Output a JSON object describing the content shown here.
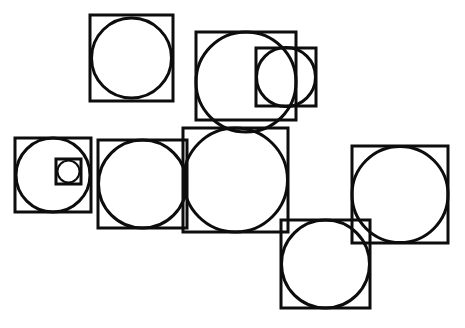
{
  "figure": {
    "canvas": {
      "width": 465,
      "height": 328,
      "background": "#ffffff"
    },
    "stroke_color": "#0d0d0d",
    "fill_color": "none",
    "groups": [
      {
        "id": "group-1-top-left",
        "label": "top-left square with inscribed circle",
        "square": {
          "x": 90,
          "y": 15,
          "w": 83,
          "h": 86,
          "stroke_width": 3
        },
        "circle": {
          "cx": 131.5,
          "cy": 58,
          "r": 40,
          "stroke_width": 3
        }
      },
      {
        "id": "group-2-top-middle",
        "label": "top-middle large square with inscribed circle",
        "square": {
          "x": 196,
          "y": 32,
          "w": 100,
          "h": 88,
          "stroke_width": 3
        },
        "circle": {
          "cx": 246,
          "cy": 82,
          "r": 50,
          "stroke_width": 3
        }
      },
      {
        "id": "group-3-top-right-small",
        "label": "top-right small square with inscribed circle",
        "square": {
          "x": 256,
          "y": 48,
          "w": 60,
          "h": 58,
          "stroke_width": 3
        },
        "circle": {
          "cx": 286,
          "cy": 77,
          "r": 29.5,
          "stroke_width": 3
        }
      },
      {
        "id": "group-4-left-small",
        "label": "left square with inscribed circle and nested square",
        "square": {
          "x": 15,
          "y": 138,
          "w": 76,
          "h": 74,
          "stroke_width": 3
        },
        "circle": {
          "cx": 53,
          "cy": 175,
          "r": 37,
          "stroke_width": 3
        },
        "nested_square": {
          "x": 56,
          "y": 159,
          "w": 25,
          "h": 25,
          "stroke_width": 3
        },
        "nested_circle": {
          "cx": 68.5,
          "cy": 171.5,
          "r": 11,
          "stroke_width": 2
        }
      },
      {
        "id": "group-5-mid-left",
        "label": "middle-left square with inscribed circle",
        "square": {
          "x": 98,
          "y": 140,
          "w": 89,
          "h": 88,
          "stroke_width": 3
        },
        "circle": {
          "cx": 142.5,
          "cy": 184,
          "r": 44,
          "stroke_width": 3
        }
      },
      {
        "id": "group-6-center",
        "label": "center large square with inscribed circle",
        "square": {
          "x": 183,
          "y": 128,
          "w": 105,
          "h": 104,
          "stroke_width": 3
        },
        "circle": {
          "cx": 235.5,
          "cy": 180,
          "r": 52,
          "stroke_width": 3
        }
      },
      {
        "id": "group-7-bottom-middle",
        "label": "bottom-middle square with inscribed circle",
        "square": {
          "x": 281,
          "y": 220,
          "w": 89,
          "h": 88,
          "stroke_width": 3
        },
        "circle": {
          "cx": 325.5,
          "cy": 264,
          "r": 44,
          "stroke_width": 3
        }
      },
      {
        "id": "group-8-right",
        "label": "right square with inscribed circle",
        "square": {
          "x": 352,
          "y": 146,
          "w": 96,
          "h": 97,
          "stroke_width": 3
        },
        "circle": {
          "cx": 400,
          "cy": 194.5,
          "r": 48,
          "stroke_width": 3
        }
      }
    ]
  }
}
